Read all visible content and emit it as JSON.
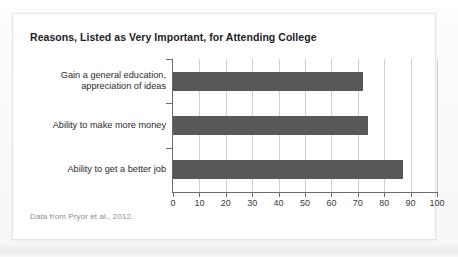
{
  "card": {
    "title": "Reasons, Listed as Very Important, for Attending College",
    "source_note": "Data from Pryor et al., 2012."
  },
  "chart_data": {
    "type": "bar",
    "orientation": "horizontal",
    "title": "Reasons, Listed as Very Important, for Attending College",
    "subtitle": "",
    "xlabel": "",
    "ylabel": "",
    "categories": [
      "Gain a general education, appreciation of ideas",
      "Ability to make more money",
      "Ability to get a better job"
    ],
    "category_lines": [
      [
        "Gain a general education,",
        "appreciation of ideas"
      ],
      [
        "Ability to make more money"
      ],
      [
        "Ability to get a better job"
      ]
    ],
    "values": [
      72,
      74,
      87
    ],
    "xlim": [
      0,
      100
    ],
    "xticks": [
      0,
      10,
      20,
      30,
      40,
      50,
      60,
      70,
      80,
      90,
      100
    ],
    "xtick_labels": [
      "0",
      "10",
      "20",
      "30",
      "40",
      "50",
      "60",
      "70",
      "80",
      "90",
      "100"
    ],
    "grid": true,
    "grid_axis": "x",
    "legend": false,
    "bar_color": "#585858",
    "grid_color": "#cfcfd1",
    "axis_color": "#6c6c6e",
    "background": "#ffffff",
    "annotation": "Data from Pryor et al., 2012."
  }
}
